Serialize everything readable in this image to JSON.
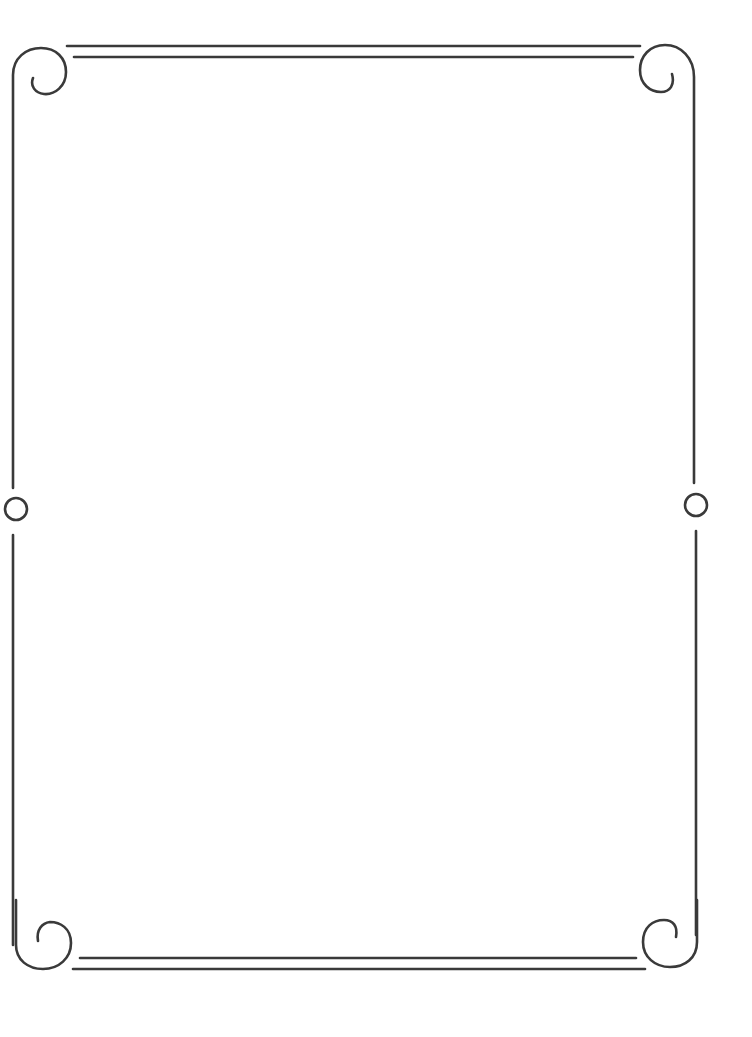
{
  "page": {
    "kind": "decorative-page-border",
    "background": "#ffffff"
  },
  "border": {
    "stroke_color": "#3a3a3a",
    "stroke_width": 2.6,
    "corners": [
      "top-left-scroll",
      "top-right-scroll",
      "bottom-left-scroll",
      "bottom-right-scroll"
    ],
    "side_ornaments": [
      "left-circle",
      "right-circle"
    ],
    "top_rule": "double-line",
    "bottom_rule": "double-line"
  }
}
